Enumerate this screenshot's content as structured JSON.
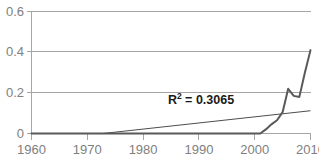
{
  "chart_data": {
    "type": "line",
    "title": "",
    "xlabel": "",
    "ylabel": "",
    "xlim": [
      1960,
      2010
    ],
    "ylim": [
      0,
      0.6
    ],
    "grid": true,
    "legend": false,
    "x_ticks": [
      "1960",
      "1970",
      "1980",
      "1990",
      "2000",
      "2010"
    ],
    "x_tick_values": [
      1960,
      1970,
      1980,
      1990,
      2000,
      2010
    ],
    "y_ticks": [
      "0",
      "0.2",
      "0.4",
      "0.6"
    ],
    "y_tick_values": [
      0,
      0.2,
      0.4,
      0.6
    ],
    "annotations": [
      {
        "name": "r-squared",
        "base": "R",
        "superscript": "2",
        "rest": " = 0.3065",
        "text": "R2 = 0.3065",
        "value": 0.3065
      }
    ],
    "series": [
      {
        "name": "data",
        "color": "#595959",
        "x": [
          1960,
          1965,
          1970,
          1975,
          1980,
          1985,
          1990,
          1995,
          2000,
          2001,
          2002,
          2003,
          2004,
          2005,
          2006,
          2007,
          2008,
          2009,
          2010
        ],
        "values": [
          0,
          0,
          0,
          0,
          0,
          0,
          0,
          0,
          0,
          0,
          0.02,
          0.045,
          0.065,
          0.105,
          0.22,
          0.185,
          0.18,
          0.3,
          0.41
        ]
      },
      {
        "name": "linear-trendline",
        "color": "#4d4d4d",
        "x": [
          1960,
          2010
        ],
        "values": [
          -0.0385,
          0.112
        ],
        "x_intercept": 1976
      }
    ]
  }
}
